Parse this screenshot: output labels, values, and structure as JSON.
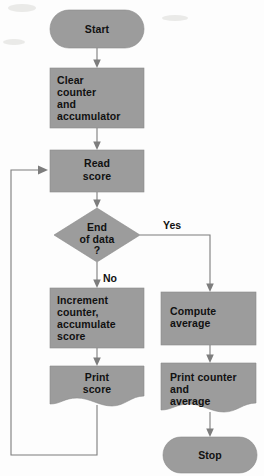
{
  "diagram": {
    "fill_color": "#9c9c9c",
    "line_color": "#7d7d7d",
    "text_color": "#111111",
    "background_color": "#fdfdfd"
  },
  "nodes": {
    "start": {
      "type": "terminator",
      "label": "Start"
    },
    "clear": {
      "type": "process",
      "lines": [
        "Clear",
        "counter",
        "and",
        "accumulator"
      ]
    },
    "read": {
      "type": "process",
      "lines": [
        "Read",
        "score"
      ]
    },
    "decision": {
      "type": "decision",
      "lines": [
        "End",
        "of data",
        "?"
      ]
    },
    "increment": {
      "type": "process",
      "lines": [
        "Increment",
        "counter,",
        "accumulate",
        "score"
      ]
    },
    "print_score": {
      "type": "document",
      "lines": [
        "Print",
        "score"
      ]
    },
    "compute": {
      "type": "process",
      "lines": [
        "Compute",
        "average"
      ]
    },
    "print_totals": {
      "type": "document",
      "lines": [
        "Print counter",
        "and",
        "average"
      ]
    },
    "stop": {
      "type": "terminator",
      "label": "Stop"
    }
  },
  "edges": {
    "yes_label": "Yes",
    "no_label": "No"
  }
}
